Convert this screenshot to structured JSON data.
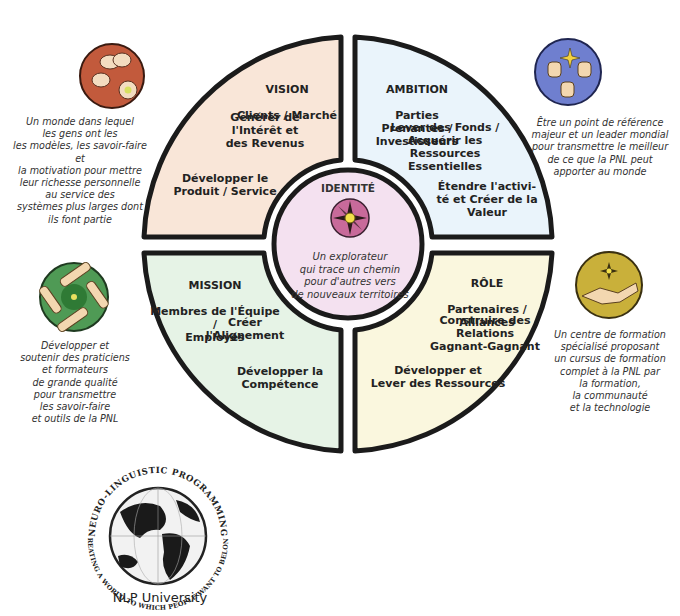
{
  "colors": {
    "vision_fill": "#f9e6d8",
    "ambition_fill": "#eaf4fb",
    "mission_fill": "#e6f3e6",
    "role_fill": "#faf7de",
    "identity_fill": "#f4e1f0",
    "outline": "#1b1b1b",
    "icon_vision": "#c25a3c",
    "icon_ambition": "#6f7fcf",
    "icon_mission": "#4f9a55",
    "icon_role": "#c9b03a",
    "icon_identity": "#c86a9a"
  },
  "quadrants": {
    "vision": {
      "title": "VISION",
      "subtitle": "Clients / Marché",
      "items": [
        "Générer de\nl'Intérêt et\ndes Revenus",
        "Développer le\nProduit / Service"
      ]
    },
    "ambition": {
      "title": "AMBITION",
      "subtitle": "Parties Prenantes /\nInvestisseurs",
      "items": [
        "Lever des Fonds /\nAcquérir les\nRessources\nEssentielles",
        "Étendre l'activi-\nté et Créer de la\nValeur"
      ]
    },
    "mission": {
      "title": "MISSION",
      "subtitle": "Membres de l'Équipe /\nEmployés",
      "items": [
        "Créer\nl'Alignement",
        "Développer la\nCompétence"
      ]
    },
    "role": {
      "title": "RÔLE",
      "subtitle": "Partenaires /\nAlliances",
      "items": [
        "Construire des\nRelations\nGagnant-Gagnant",
        "Développer et\nLever des Ressources"
      ]
    }
  },
  "identity": {
    "title": "IDENTITÉ",
    "description": "Un explorateur\nqui trace un chemin\npour d'autres vers\nde nouveaux territoires",
    "icon": "compass-star-icon"
  },
  "side_notes": {
    "vision": {
      "icon": "reaching-hands-icon",
      "text": "Un monde dans lequel\nles gens ont les\nles modèles, les savoir-faire et\nla motivation pour mettre\nleur richesse personnelle\nau service des\nsystèmes plus larges dont\nils font partie"
    },
    "ambition": {
      "icon": "thumbs-up-icon",
      "text": "Être un point de référence\nmajeur et un leader mondial\npour transmettre  le meilleur\nde ce que la PNL  peut\napporter au monde"
    },
    "mission": {
      "icon": "linked-hands-icon",
      "text": "Développer et\nsoutenir des praticiens\net formateurs\nde grande qualité\npour transmettre\nles savoir-faire\net outils de la PNL"
    },
    "role": {
      "icon": "handshake-icon",
      "text": "Un centre de formation\nspécialisé proposant\nun cursus de formation\ncomplet à la PNL par\nla formation,\nla communauté\net la technologie"
    }
  },
  "logo": {
    "top_arc": "NEURO-LINGUISTIC PROGRAMMING",
    "bottom_arc": "CREATING A WORLD TO WHICH PEOPLE WANT TO BELONG",
    "label": "NLP University"
  }
}
